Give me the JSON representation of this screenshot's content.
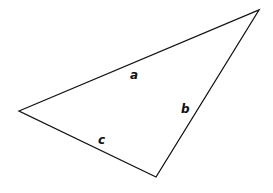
{
  "diagram": {
    "type": "triangle",
    "vertices": {
      "left": [
        19,
        111
      ],
      "top_right": [
        259,
        10
      ],
      "bottom": [
        156,
        177
      ]
    },
    "stroke_color": "#111111",
    "sides": [
      {
        "label": "a",
        "from": "left",
        "to": "top_right"
      },
      {
        "label": "b",
        "from": "top_right",
        "to": "bottom"
      },
      {
        "label": "c",
        "from": "bottom",
        "to": "left"
      }
    ]
  }
}
